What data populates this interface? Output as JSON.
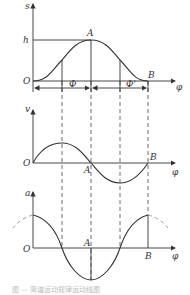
{
  "diagram": {
    "panels": [
      {
        "id": "displacement",
        "y_axis_label": "s",
        "x_axis_label": "φ",
        "origin_label": "O",
        "level_label": "h",
        "points": {
          "peak": "A",
          "end": "B"
        },
        "interval_labels": [
          "Φ",
          "Φ'"
        ]
      },
      {
        "id": "velocity",
        "y_axis_label": "v",
        "x_axis_label": "φ",
        "origin_label": "O",
        "points": {
          "mid": "A",
          "end": "B"
        }
      },
      {
        "id": "acceleration",
        "y_axis_label": "a",
        "x_axis_label": "φ",
        "origin_label": "O",
        "points": {
          "mid": "A",
          "end": "B"
        }
      }
    ],
    "caption": "图 — 简谐运动规律运动线图"
  },
  "colors": {
    "line": "#333333",
    "dash": "#444444",
    "dash_ext": "#999999"
  }
}
